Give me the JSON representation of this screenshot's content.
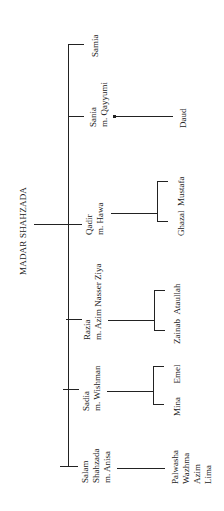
{
  "title": "MADAR SHAHZADA",
  "children": [
    {
      "name": "Salam",
      "lines": [
        "Salam",
        "Shahzada",
        "m. Anisa"
      ],
      "offspring": [
        "Palwasha",
        "Wazhma",
        "Azim",
        "Lima"
      ]
    },
    {
      "name": "Sadia",
      "lines": [
        "Sadia",
        "m. Wishman"
      ],
      "offspring": [
        "Mina",
        "Emel"
      ]
    },
    {
      "name": "Razia",
      "lines": [
        "Razia",
        "m. Azim Nasser Ziya"
      ],
      "offspring": [
        "Zainab",
        "Ataullah"
      ]
    },
    {
      "name": "Qadir",
      "lines": [
        "Qadir",
        "m. Hawa"
      ],
      "offspring": [
        "Ghazal",
        "Mustafa"
      ]
    },
    {
      "name": "Sania",
      "lines": [
        "Sania",
        "m. Qayyumi"
      ],
      "offspring": [
        "Daud"
      ]
    },
    {
      "name": "Samia",
      "lines": [
        "Samia"
      ],
      "offspring": []
    }
  ]
}
